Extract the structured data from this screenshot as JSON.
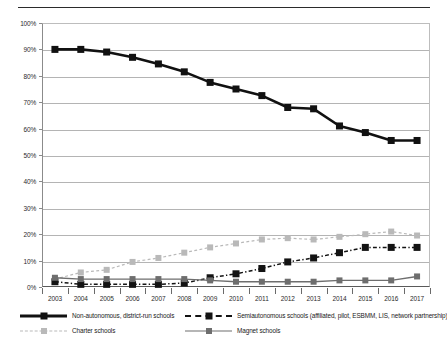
{
  "chart_data": {
    "type": "line",
    "title": "",
    "subtitle": "",
    "xlabel": "",
    "ylabel": "",
    "categories": [
      "2003",
      "2004",
      "2005",
      "2006",
      "2007",
      "2008",
      "2009",
      "2010",
      "2011",
      "2012",
      "2013",
      "2014",
      "2015",
      "2016",
      "2017"
    ],
    "ylim": [
      0,
      100
    ],
    "ytick_labels": [
      "0%",
      "10%",
      "20%",
      "30%",
      "40%",
      "50%",
      "60%",
      "70%",
      "80%",
      "90%",
      "100%"
    ],
    "ytick_values": [
      0,
      10,
      20,
      30,
      40,
      50,
      60,
      70,
      80,
      90,
      100
    ],
    "grid": "horizontal",
    "legend_position": "bottom",
    "series": [
      {
        "name": "Non-autonomous, district-run schools",
        "color": "#111111",
        "line_style": "solid",
        "line_width": 2.6,
        "marker": "square",
        "marker_size": 7,
        "values": [
          90,
          90,
          89,
          87,
          84.5,
          81.5,
          77.5,
          75,
          72.5,
          68,
          67.5,
          61,
          58.5,
          55.5,
          55.5
        ]
      },
      {
        "name": "Charter schools",
        "color": "#b9b9b9",
        "line_style": "dashed",
        "line_width": 1.2,
        "marker": "square",
        "marker_size": 6,
        "values": [
          3,
          5.5,
          6.5,
          9.5,
          11,
          13,
          15,
          16.5,
          18,
          18.5,
          18,
          19,
          20,
          21,
          19.5
        ]
      },
      {
        "name": "Semiautonomous schools (affiliated, pilot, ESBMM, LIS, network partnership)",
        "color": "#131313",
        "line_style": "dashdot",
        "line_width": 1.5,
        "marker": "square",
        "marker_size": 7,
        "values": [
          2,
          1,
          1,
          1,
          1,
          1.5,
          3.5,
          5,
          7,
          9.5,
          11,
          13,
          15,
          15,
          15
        ]
      },
      {
        "name": "Magnet schools",
        "color": "#6e6e6e",
        "line_style": "solid",
        "line_width": 1.4,
        "marker": "square",
        "marker_size": 6,
        "values": [
          3.5,
          3,
          3,
          3,
          3,
          3,
          2.5,
          2,
          2,
          2,
          2,
          2.5,
          2.5,
          2.5,
          4
        ]
      }
    ]
  },
  "legend": {
    "items": [
      {
        "label": "Non-autonomous, district-run schools",
        "series_index": 0
      },
      {
        "label": "Charter schools",
        "series_index": 1
      },
      {
        "label": "Semiautonomous schools (affiliated, pilot, ESBMM, LIS, network partnership)",
        "series_index": 2
      },
      {
        "label": "Magnet schools",
        "series_index": 3
      }
    ]
  }
}
